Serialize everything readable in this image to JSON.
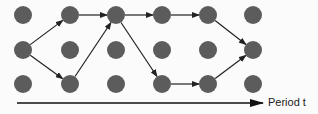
{
  "diagram": {
    "type": "lattice-path",
    "columns_x": [
      23,
      70,
      116,
      162,
      208,
      253
    ],
    "rows_y": [
      15,
      50,
      84
    ],
    "dot_color": "#5c5c5c",
    "arrow_color": "#222222",
    "edges": [
      {
        "from": [
          0,
          1
        ],
        "to": [
          1,
          0
        ]
      },
      {
        "from": [
          0,
          1
        ],
        "to": [
          1,
          2
        ]
      },
      {
        "from": [
          1,
          0
        ],
        "to": [
          2,
          0
        ]
      },
      {
        "from": [
          1,
          2
        ],
        "to": [
          2,
          0
        ]
      },
      {
        "from": [
          2,
          0
        ],
        "to": [
          3,
          0
        ]
      },
      {
        "from": [
          2,
          0
        ],
        "to": [
          3,
          2
        ]
      },
      {
        "from": [
          3,
          0
        ],
        "to": [
          4,
          0
        ]
      },
      {
        "from": [
          3,
          2
        ],
        "to": [
          4,
          2
        ]
      },
      {
        "from": [
          4,
          0
        ],
        "to": [
          5,
          1
        ]
      },
      {
        "from": [
          4,
          2
        ],
        "to": [
          5,
          1
        ]
      }
    ],
    "axis": {
      "label": "Period t"
    }
  }
}
